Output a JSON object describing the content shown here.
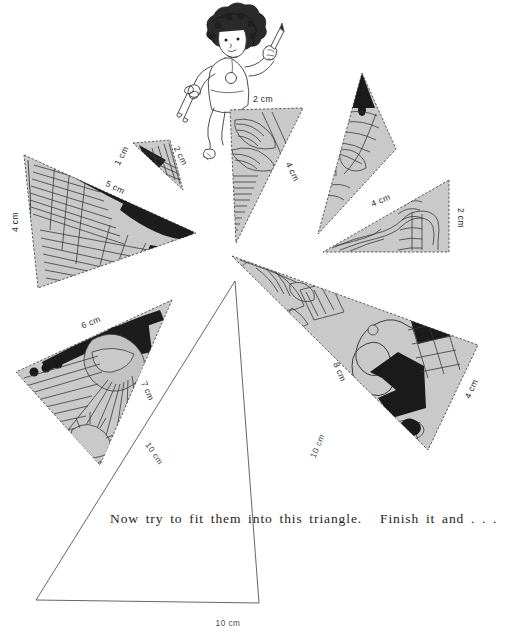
{
  "page": {
    "background_color": "#ffffff",
    "width": 525,
    "height": 639
  },
  "colors": {
    "piece_fill": "#c9c9c9",
    "piece_fill_light": "#d6d6d6",
    "piece_dark": "#1a1a1a",
    "ink": "#3a3a3a",
    "text": "#1c1c1c",
    "outline_triangle_stroke": "#555555"
  },
  "illustration": {
    "figure": {
      "name": "child-with-pencil-and-scissors",
      "description": "child with curly dark hair holding a pencil in one hand and scissors in the other"
    }
  },
  "caption": {
    "main_text": "Now try to fit them into this triangle.",
    "tail_text": "Finish it and . . ."
  },
  "outline_triangle": {
    "name": "empty-target-triangle",
    "labels": {
      "left_side": "10 cm",
      "right_side": "10 cm",
      "base": "10 cm"
    }
  },
  "pieces": [
    {
      "id": "piece-tiny-top",
      "name": "triangle-piece-tiny",
      "labels": [
        "1 cm",
        "2 cm"
      ],
      "fill": "#c9c9c9"
    },
    {
      "id": "piece-left-large",
      "name": "triangle-piece-left-large",
      "labels": [
        "4 cm",
        "5 cm"
      ],
      "fill": "#c9c9c9"
    },
    {
      "id": "piece-center-top",
      "name": "triangle-piece-center-top",
      "labels": [
        "2 cm",
        "4 cm"
      ],
      "fill": "#c9c9c9"
    },
    {
      "id": "piece-upper-right-narrow",
      "name": "triangle-piece-upper-right-narrow",
      "labels": [],
      "fill": "#c9c9c9"
    },
    {
      "id": "piece-right",
      "name": "triangle-piece-right",
      "labels": [
        "4 cm",
        "2 cm"
      ],
      "fill": "#c9c9c9"
    },
    {
      "id": "piece-bottom-left",
      "name": "triangle-piece-bottom-left",
      "labels": [
        "6 cm",
        "7 cm"
      ],
      "fill": "#c9c9c9"
    },
    {
      "id": "piece-bottom-right",
      "name": "triangle-piece-bottom-right",
      "labels": [
        "8 cm",
        "4 cm"
      ],
      "fill": "#c9c9c9"
    }
  ],
  "dimension_labels": {
    "tiny_a": "1 cm",
    "tiny_b": "2 cm",
    "left_vertical": "4 cm",
    "left_hyp": "5 cm",
    "center_top": "2 cm",
    "center_right": "4 cm",
    "right_hyp": "4 cm",
    "right_vertical": "2 cm",
    "bottomleft_top": "6 cm",
    "bottomleft_right": "7 cm",
    "bottomright_left": "8 cm",
    "bottomright_right": "4 cm",
    "outline_left": "10 cm",
    "outline_right": "10 cm",
    "outline_base": "10 cm"
  }
}
